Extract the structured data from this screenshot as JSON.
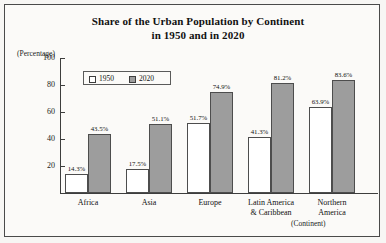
{
  "chart_data": {
    "type": "bar",
    "title": "Share of the Urban Population by Continent in 1950 and in 2020",
    "title_line1": "Share of the Urban Population by Continent",
    "title_line2": "in 1950 and in 2020",
    "unit_label": "(Percentage)",
    "xlabel": "(Continent)",
    "ylabel": "(Percentage)",
    "ylim": [
      0,
      100
    ],
    "yticks": [
      20,
      40,
      60,
      80,
      100
    ],
    "ytick_labels": [
      "20",
      "40",
      "60",
      "80",
      "100"
    ],
    "grid": false,
    "legend_position": "top-left-inside",
    "categories": [
      "Africa",
      "Asia",
      "Europe",
      "Latin America & Caribbean",
      "Northern America"
    ],
    "category_lines": [
      [
        "Africa"
      ],
      [
        "Asia"
      ],
      [
        "Europe"
      ],
      [
        "Latin America",
        "& Caribbean"
      ],
      [
        "Northern",
        "America"
      ]
    ],
    "series": [
      {
        "name": "1950",
        "color": "#ffffff",
        "values": [
          14.3,
          17.5,
          51.7,
          41.3,
          63.9
        ],
        "labels": [
          "14.3%",
          "17.5%",
          "51.7%",
          "41.3%",
          "63.9%"
        ]
      },
      {
        "name": "2020",
        "color": "#9d9d9d",
        "values": [
          43.5,
          51.1,
          74.9,
          81.2,
          83.6
        ],
        "labels": [
          "43.5%",
          "51.1%",
          "74.9%",
          "81.2%",
          "83.6%"
        ]
      }
    ]
  },
  "legend": {
    "items": [
      {
        "label": "1950",
        "color": "#ffffff"
      },
      {
        "label": "2020",
        "color": "#9d9d9d"
      }
    ]
  },
  "colors": {
    "series_1950": "#ffffff",
    "series_2020": "#9d9d9d",
    "axis": "#3d3d3d",
    "frame": "#4a4a4a",
    "text": "#101010",
    "background": "#fbfaf8"
  }
}
